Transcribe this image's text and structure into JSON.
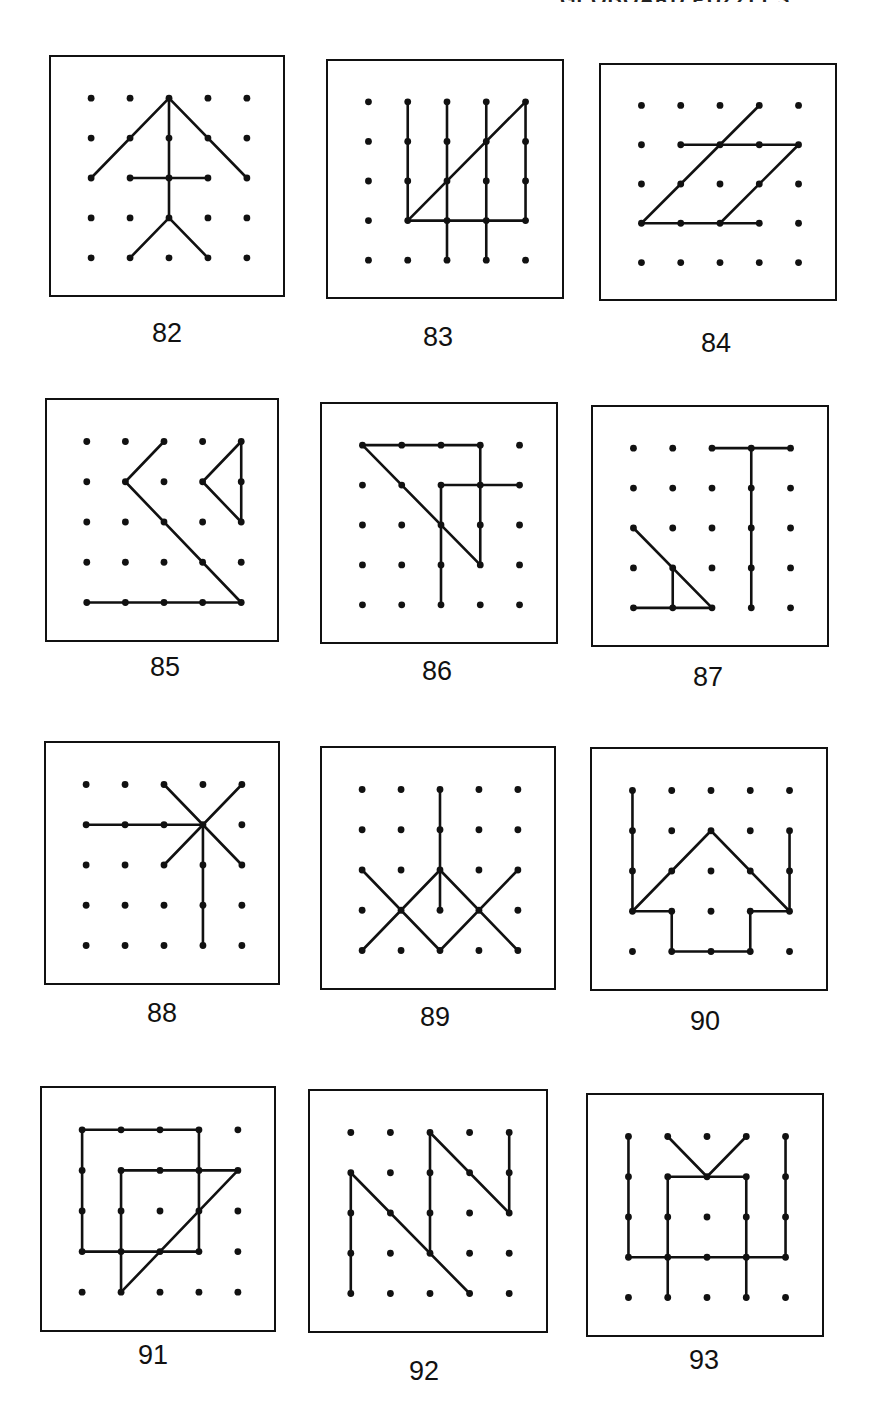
{
  "header": {
    "text": "GEOBOARD PUZZLES"
  },
  "grid": {
    "cols": 5,
    "rows": 5
  },
  "puzzles": [
    {
      "number": "82",
      "box": {
        "x": 49,
        "y": 55,
        "w": 236,
        "h": 242
      },
      "label_pos": {
        "x": 127,
        "y": 318
      },
      "segments": [
        [
          [
            0,
            2
          ],
          [
            2,
            0
          ]
        ],
        [
          [
            2,
            0
          ],
          [
            4,
            2
          ]
        ],
        [
          [
            2,
            0
          ],
          [
            2,
            3
          ]
        ],
        [
          [
            1,
            2
          ],
          [
            3,
            2
          ]
        ],
        [
          [
            2,
            3
          ],
          [
            1,
            4
          ]
        ],
        [
          [
            2,
            3
          ],
          [
            3,
            4
          ]
        ]
      ]
    },
    {
      "number": "83",
      "box": {
        "x": 326,
        "y": 59,
        "w": 238,
        "h": 240
      },
      "label_pos": {
        "x": 398,
        "y": 322
      },
      "segments": [
        [
          [
            1,
            0
          ],
          [
            1,
            3
          ]
        ],
        [
          [
            2,
            0
          ],
          [
            2,
            4
          ]
        ],
        [
          [
            3,
            0
          ],
          [
            3,
            4
          ]
        ],
        [
          [
            4,
            0
          ],
          [
            4,
            3
          ]
        ],
        [
          [
            1,
            3
          ],
          [
            4,
            3
          ]
        ],
        [
          [
            1,
            3
          ],
          [
            4,
            0
          ]
        ]
      ]
    },
    {
      "number": "84",
      "box": {
        "x": 599,
        "y": 63,
        "w": 238,
        "h": 238
      },
      "label_pos": {
        "x": 676,
        "y": 328
      },
      "segments": [
        [
          [
            1,
            1
          ],
          [
            4,
            1
          ]
        ],
        [
          [
            0,
            3
          ],
          [
            3,
            3
          ]
        ],
        [
          [
            0,
            3
          ],
          [
            3,
            0
          ]
        ],
        [
          [
            2,
            3
          ],
          [
            4,
            1
          ]
        ]
      ]
    },
    {
      "number": "85",
      "box": {
        "x": 45,
        "y": 398,
        "w": 234,
        "h": 244
      },
      "label_pos": {
        "x": 125,
        "y": 652
      },
      "segments": [
        [
          [
            2,
            0
          ],
          [
            1,
            1
          ]
        ],
        [
          [
            1,
            1
          ],
          [
            4,
            4
          ]
        ],
        [
          [
            0,
            4
          ],
          [
            4,
            4
          ]
        ],
        [
          [
            4,
            0
          ],
          [
            3,
            1
          ]
        ],
        [
          [
            3,
            1
          ],
          [
            4,
            2
          ]
        ],
        [
          [
            4,
            0
          ],
          [
            4,
            2
          ]
        ]
      ]
    },
    {
      "number": "86",
      "box": {
        "x": 320,
        "y": 402,
        "w": 238,
        "h": 242
      },
      "label_pos": {
        "x": 397,
        "y": 656
      },
      "segments": [
        [
          [
            0,
            0
          ],
          [
            3,
            0
          ]
        ],
        [
          [
            3,
            0
          ],
          [
            3,
            3
          ]
        ],
        [
          [
            0,
            0
          ],
          [
            3,
            3
          ]
        ],
        [
          [
            2,
            1
          ],
          [
            4,
            1
          ]
        ],
        [
          [
            2,
            1
          ],
          [
            2,
            4
          ]
        ]
      ]
    },
    {
      "number": "87",
      "box": {
        "x": 591,
        "y": 405,
        "w": 238,
        "h": 242
      },
      "label_pos": {
        "x": 668,
        "y": 662
      },
      "segments": [
        [
          [
            2,
            0
          ],
          [
            4,
            0
          ]
        ],
        [
          [
            3,
            0
          ],
          [
            3,
            4
          ]
        ],
        [
          [
            0,
            2
          ],
          [
            2,
            4
          ]
        ],
        [
          [
            1,
            3
          ],
          [
            1,
            4
          ]
        ],
        [
          [
            0,
            4
          ],
          [
            2,
            4
          ]
        ]
      ]
    },
    {
      "number": "88",
      "box": {
        "x": 44,
        "y": 741,
        "w": 236,
        "h": 244
      },
      "label_pos": {
        "x": 122,
        "y": 998
      },
      "segments": [
        [
          [
            0,
            1
          ],
          [
            3,
            1
          ]
        ],
        [
          [
            2,
            0
          ],
          [
            4,
            2
          ]
        ],
        [
          [
            4,
            0
          ],
          [
            2,
            2
          ]
        ],
        [
          [
            3,
            1
          ],
          [
            3,
            4
          ]
        ]
      ]
    },
    {
      "number": "89",
      "box": {
        "x": 320,
        "y": 746,
        "w": 236,
        "h": 244
      },
      "label_pos": {
        "x": 395,
        "y": 1002
      },
      "segments": [
        [
          [
            2,
            0
          ],
          [
            2,
            3
          ]
        ],
        [
          [
            0,
            2
          ],
          [
            2,
            4
          ]
        ],
        [
          [
            0,
            4
          ],
          [
            2,
            2
          ]
        ],
        [
          [
            2,
            2
          ],
          [
            4,
            4
          ]
        ],
        [
          [
            2,
            4
          ],
          [
            4,
            2
          ]
        ]
      ]
    },
    {
      "number": "90",
      "box": {
        "x": 590,
        "y": 747,
        "w": 238,
        "h": 244
      },
      "label_pos": {
        "x": 665,
        "y": 1006
      },
      "segments": [
        [
          [
            0,
            0
          ],
          [
            0,
            3
          ]
        ],
        [
          [
            4,
            1
          ],
          [
            4,
            3
          ]
        ],
        [
          [
            0,
            3
          ],
          [
            2,
            1
          ]
        ],
        [
          [
            2,
            1
          ],
          [
            4,
            3
          ]
        ],
        [
          [
            0,
            3
          ],
          [
            1,
            3
          ]
        ],
        [
          [
            1,
            3
          ],
          [
            1,
            4
          ]
        ],
        [
          [
            1,
            4
          ],
          [
            3,
            4
          ]
        ],
        [
          [
            3,
            4
          ],
          [
            3,
            3
          ]
        ],
        [
          [
            3,
            3
          ],
          [
            4,
            3
          ]
        ]
      ]
    },
    {
      "number": "91",
      "box": {
        "x": 40,
        "y": 1086,
        "w": 236,
        "h": 246
      },
      "label_pos": {
        "x": 113,
        "y": 1340
      },
      "segments": [
        [
          [
            0,
            0
          ],
          [
            3,
            0
          ]
        ],
        [
          [
            3,
            0
          ],
          [
            3,
            3
          ]
        ],
        [
          [
            0,
            3
          ],
          [
            3,
            3
          ]
        ],
        [
          [
            0,
            0
          ],
          [
            0,
            3
          ]
        ],
        [
          [
            1,
            1
          ],
          [
            4,
            1
          ]
        ],
        [
          [
            1,
            1
          ],
          [
            1,
            4
          ]
        ],
        [
          [
            1,
            4
          ],
          [
            4,
            1
          ]
        ]
      ]
    },
    {
      "number": "92",
      "box": {
        "x": 308,
        "y": 1089,
        "w": 240,
        "h": 244
      },
      "label_pos": {
        "x": 384,
        "y": 1356
      },
      "segments": [
        [
          [
            0,
            1
          ],
          [
            0,
            4
          ]
        ],
        [
          [
            0,
            1
          ],
          [
            3,
            4
          ]
        ],
        [
          [
            2,
            0
          ],
          [
            2,
            3
          ]
        ],
        [
          [
            2,
            0
          ],
          [
            4,
            2
          ]
        ],
        [
          [
            4,
            0
          ],
          [
            4,
            2
          ]
        ]
      ]
    },
    {
      "number": "93",
      "box": {
        "x": 586,
        "y": 1093,
        "w": 238,
        "h": 244
      },
      "label_pos": {
        "x": 664,
        "y": 1345
      },
      "segments": [
        [
          [
            0,
            0
          ],
          [
            0,
            3
          ]
        ],
        [
          [
            4,
            0
          ],
          [
            4,
            3
          ]
        ],
        [
          [
            0,
            3
          ],
          [
            4,
            3
          ]
        ],
        [
          [
            1,
            1
          ],
          [
            3,
            1
          ]
        ],
        [
          [
            1,
            1
          ],
          [
            1,
            4
          ]
        ],
        [
          [
            3,
            1
          ],
          [
            3,
            4
          ]
        ],
        [
          [
            1,
            0
          ],
          [
            2,
            1
          ]
        ],
        [
          [
            3,
            0
          ],
          [
            2,
            1
          ]
        ]
      ]
    }
  ]
}
